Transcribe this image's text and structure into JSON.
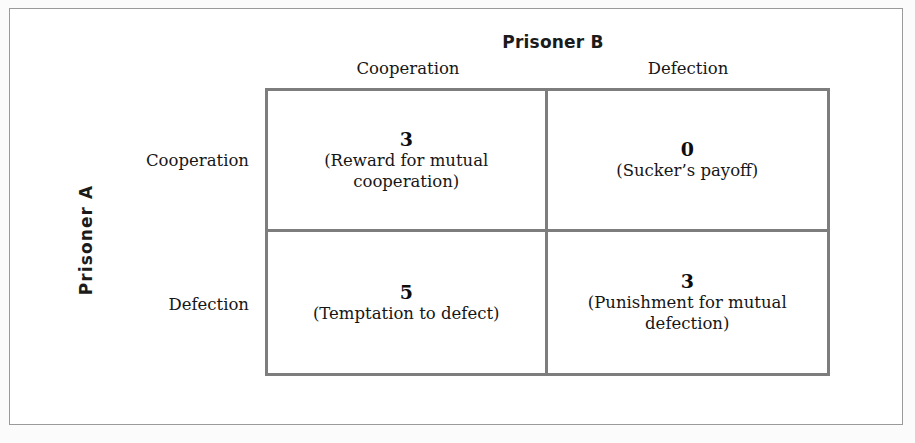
{
  "figure": {
    "column_group_title": "Prisoner B",
    "row_group_title": "Prisoner A",
    "column_headers": [
      "Cooperation",
      "Defection"
    ],
    "row_headers": [
      "Cooperation",
      "Defection"
    ],
    "colors": {
      "matrix_border": "#7d7d7d",
      "outer_frame": "#9a9a9a",
      "cell_background": "#ffffff",
      "text": "#161616"
    },
    "cells": [
      {
        "row": "Cooperation",
        "column": "Cooperation",
        "value": "3",
        "description": "(Reward for mutual cooperation)"
      },
      {
        "row": "Cooperation",
        "column": "Defection",
        "value": "0",
        "description": "(Sucker’s payoff)"
      },
      {
        "row": "Defection",
        "column": "Cooperation",
        "value": "5",
        "description": "(Temptation to defect)"
      },
      {
        "row": "Defection",
        "column": "Defection",
        "value": "3",
        "description": "(Punishment for mutual defection)"
      }
    ]
  },
  "chart_data": {
    "type": "table",
    "xlabel": "Prisoner B",
    "ylabel": "Prisoner A",
    "categories": [
      "Cooperation",
      "Defection"
    ],
    "row_categories": [
      "Cooperation",
      "Defection"
    ],
    "column_categories": [
      "Cooperation",
      "Defection"
    ],
    "values": [
      [
        3,
        0
      ],
      [
        5,
        3
      ]
    ],
    "cell_labels": [
      [
        "(Reward for mutual cooperation)",
        "(Sucker’s payoff)"
      ],
      [
        "(Temptation to defect)",
        "(Punishment for mutual defection)"
      ]
    ],
    "grid": true,
    "legend": "none"
  }
}
